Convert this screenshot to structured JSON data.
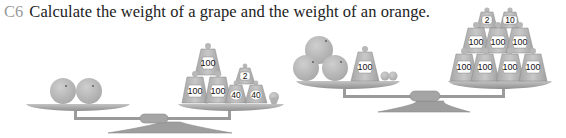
{
  "question": {
    "number": "C6",
    "text": "Calculate the weight of a grape and the weight of an orange."
  },
  "colors": {
    "question_number": "#9a9a9a",
    "text": "#222222",
    "fruit": "#b8b8b8",
    "weight": "#bdbdbd",
    "pan": "#a9a9a9",
    "label_bg": "#ffffff"
  },
  "scales": [
    {
      "id": "scale-1",
      "left_pan": {
        "oranges": 2,
        "grapes": 0,
        "weights": []
      },
      "right_pan": {
        "oranges": 0,
        "grapes": 1,
        "weights": [
          "100",
          "100",
          "100",
          "2",
          "40",
          "40"
        ]
      }
    },
    {
      "id": "scale-2",
      "left_pan": {
        "oranges": 3,
        "grapes": 2,
        "weights": [
          "100"
        ]
      },
      "right_pan": {
        "oranges": 0,
        "grapes": 0,
        "weights": [
          "2",
          "10",
          "100",
          "100",
          "100",
          "100",
          "100",
          "100",
          "100"
        ]
      }
    }
  ],
  "icons": {
    "orange": "orange-icon",
    "grape": "grape-icon",
    "weight": "weight-icon",
    "balance": "balance-scale-icon"
  }
}
